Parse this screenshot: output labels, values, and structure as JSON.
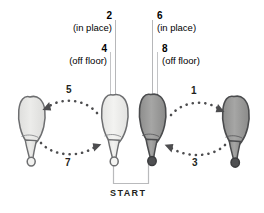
{
  "diagram": {
    "start_label": "START",
    "colors": {
      "light_foot_fill": "#e8e8e6",
      "light_foot_fill_alt": "#eeeeec",
      "dark_foot_fill": "#9a9a99",
      "outline": "#58595b",
      "text": "#231f20",
      "dot": "#4d4d4f",
      "leader": "#b6b7b9"
    },
    "steps": [
      {
        "number": "2",
        "note": "(in place)"
      },
      {
        "number": "4",
        "note": "(off floor)"
      },
      {
        "number": "6",
        "note": "(in place)"
      },
      {
        "number": "8",
        "note": "(off floor)"
      }
    ],
    "arcs": [
      {
        "number": "1",
        "direction": "right",
        "position": "upper-right"
      },
      {
        "number": "3",
        "direction": "left",
        "position": "lower-right"
      },
      {
        "number": "5",
        "direction": "left",
        "position": "upper-left"
      },
      {
        "number": "7",
        "direction": "right",
        "position": "lower-left"
      }
    ],
    "feet": [
      {
        "id": "far-left",
        "shade": "light"
      },
      {
        "id": "center-left",
        "shade": "light"
      },
      {
        "id": "center-right",
        "shade": "dark"
      },
      {
        "id": "far-right",
        "shade": "dark"
      }
    ]
  }
}
